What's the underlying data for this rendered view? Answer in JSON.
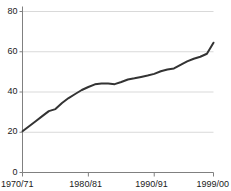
{
  "chart_data": {
    "type": "line",
    "title": "",
    "subtitle": "",
    "xlabel": "",
    "ylabel": "",
    "grid": true,
    "legend": null,
    "xlim": [
      1970,
      1999
    ],
    "ylim": [
      0,
      80
    ],
    "ytick_labels": [
      "80",
      "60",
      "40",
      "20",
      "0"
    ],
    "ytick_values": [
      80,
      60,
      40,
      20,
      0
    ],
    "xtick_labels": [
      "1970/71",
      "1980/81",
      "1990/91",
      "1999/00"
    ],
    "xtick_values": [
      1970,
      1980,
      1990,
      1999
    ],
    "line_color": "#333333",
    "grid_color": "#d9d9d9",
    "axis_color": "#808080",
    "x": [
      1970,
      1971,
      1972,
      1973,
      1974,
      1975,
      1976,
      1977,
      1978,
      1979,
      1980,
      1981,
      1982,
      1983,
      1984,
      1985,
      1986,
      1987,
      1988,
      1989,
      1990,
      1991,
      1992,
      1993,
      1994,
      1995,
      1996,
      1997,
      1998,
      1999
    ],
    "values": [
      20.5,
      23.0,
      25.5,
      28.0,
      30.5,
      31.5,
      34.5,
      37.0,
      39.0,
      41.0,
      42.5,
      43.8,
      44.2,
      44.2,
      43.9,
      45.0,
      46.2,
      46.8,
      47.5,
      48.2,
      49.0,
      50.3,
      51.2,
      51.7,
      53.5,
      55.2,
      56.5,
      57.5,
      59.0,
      64.5
    ],
    "series": [
      {
        "name": "series-1",
        "values": [
          20.5,
          23.0,
          25.5,
          28.0,
          30.5,
          31.5,
          34.5,
          37.0,
          39.0,
          41.0,
          42.5,
          43.8,
          44.2,
          44.2,
          43.9,
          45.0,
          46.2,
          46.8,
          47.5,
          48.2,
          49.0,
          50.3,
          51.2,
          51.7,
          53.5,
          55.2,
          56.5,
          57.5,
          59.0,
          64.5
        ]
      }
    ]
  }
}
